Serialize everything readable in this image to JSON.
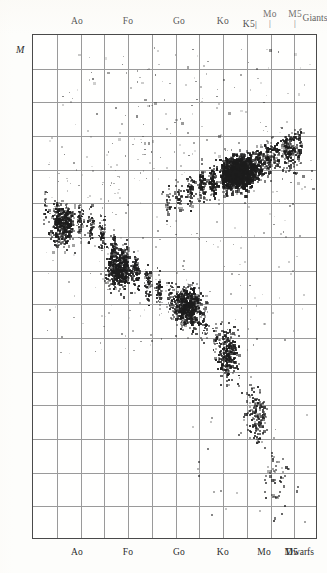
{
  "figure": {
    "magnitude_symbol": "M",
    "giants_label": "Giants",
    "dwarfs_label": "Dwarfs"
  },
  "chart_data": {
    "type": "scatter",
    "title": "",
    "xlabel": "",
    "ylabel": "M",
    "grid": true,
    "legend_position": "none",
    "top_axis_ticks": [
      "Ao",
      "Fo",
      "Go",
      "Ko",
      "K5",
      "Mo",
      "M5"
    ],
    "bottom_axis_ticks": [
      "Ao",
      "Fo",
      "Go",
      "Ko",
      "Mo",
      "M5"
    ],
    "y_tick_labels": [
      "-4",
      "-2",
      "0",
      "+2",
      "4",
      "6",
      "8",
      "10",
      "12",
      "+14"
    ],
    "y_tick_values": [
      -4,
      -2,
      0,
      2,
      4,
      6,
      8,
      10,
      12,
      14
    ],
    "ylim": [
      -5,
      14
    ],
    "x_columns": 12,
    "y_rows": 15,
    "series": [
      {
        "name": "main-sequence",
        "description": "Dwarf main sequence running from upper-left (early type, bright) to lower-right (late type, faint)"
      },
      {
        "name": "giant-branch",
        "description": "Dense horizontal giant clump near absolute magnitude 0 spanning Go through M5"
      }
    ]
  },
  "axes": {
    "top": [
      {
        "label": "Ao",
        "x_pct": 15.8,
        "stacked": false
      },
      {
        "label": "Fo",
        "x_pct": 33.7,
        "stacked": false
      },
      {
        "label": "Go",
        "x_pct": 51.6,
        "stacked": false
      },
      {
        "label": "Ko",
        "x_pct": 67.0,
        "stacked": false
      },
      {
        "label": "K5",
        "x_pct": 76.5,
        "stacked": false,
        "lower": true
      },
      {
        "label": "Mo",
        "x_pct": 83.5,
        "stacked": true
      },
      {
        "label": "M5",
        "x_pct": 92.3,
        "stacked": true
      }
    ],
    "bottom": [
      {
        "label": "Ao",
        "x_pct": 15.8
      },
      {
        "label": "Fo",
        "x_pct": 33.7
      },
      {
        "label": "Go",
        "x_pct": 51.6
      },
      {
        "label": "Ko",
        "x_pct": 67.0
      },
      {
        "label": "Mo",
        "x_pct": 81.5
      },
      {
        "label": "M5",
        "x_pct": 91.0
      }
    ],
    "y": [
      {
        "label": "-4",
        "y_pct": 7.6
      },
      {
        "label": "-2",
        "y_pct": 20.3
      },
      {
        "label": "0",
        "y_pct": 33.0
      },
      {
        "label": "+2",
        "y_pct": 45.7
      },
      {
        "label": "4",
        "y_pct": 58.3
      },
      {
        "label": "6",
        "y_pct": 71.0
      },
      {
        "label": "8",
        "y_pct": 78.2
      },
      {
        "label": "10",
        "y_pct": 85.5
      },
      {
        "label": "12",
        "y_pct": 92.5
      },
      {
        "label": "+14",
        "y_pct": 99.3
      }
    ]
  }
}
